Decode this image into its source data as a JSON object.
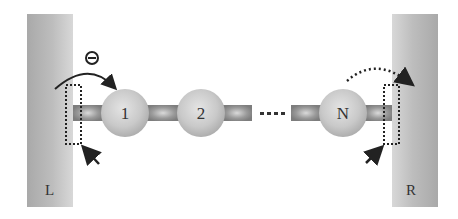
{
  "diagram": {
    "electrodes": {
      "left": {
        "label": "L"
      },
      "right": {
        "label": "R"
      }
    },
    "sites": [
      {
        "label": "1"
      },
      {
        "label": "2"
      },
      {
        "label": "N"
      }
    ],
    "ellipsis": "....",
    "charge_symbol": "⊖",
    "annotations": {
      "left_arrow": "solid curved arrow (electron injection from L onto site 1)",
      "right_arrow": "dotted curved arrow (transfer from site N to R)"
    }
  }
}
